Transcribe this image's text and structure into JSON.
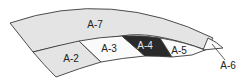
{
  "diagram": {
    "segments": [
      {
        "id": "A-7",
        "label": "A-7",
        "fill": "#e4e4e4",
        "text_color": "#222222"
      },
      {
        "id": "A-2",
        "label": "A-2",
        "fill": "#e4e4e4",
        "text_color": "#222222"
      },
      {
        "id": "A-3",
        "label": "A-3",
        "fill": "#fafafa",
        "text_color": "#222222"
      },
      {
        "id": "A-4",
        "label": "A-4",
        "fill": "#2a2a2a",
        "text_color": "#e8e8e8"
      },
      {
        "id": "A-5",
        "label": "A-5",
        "fill": "#fafafa",
        "text_color": "#222222"
      },
      {
        "id": "A-6",
        "label": "A-6",
        "fill": "#fafafa",
        "text_color": "#222222"
      }
    ]
  }
}
